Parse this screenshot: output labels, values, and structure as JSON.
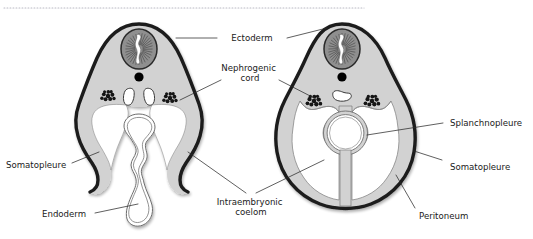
{
  "figure": {
    "top_rule": "dotted-rule",
    "background_color": "#ffffff",
    "ink_color": "#1a1a1a",
    "mesoderm_fill": "#d2d2d2",
    "neural_tube_fill": "#8f8f8f",
    "ectoderm_stroke": "#1c1c1c",
    "coelom_fill": "#ffffff",
    "notochord_fill": "#000000",
    "somite_fill": "#121212"
  },
  "labels": {
    "ectoderm": {
      "text": "Ectoderm",
      "lines": [
        "Ectoderm"
      ]
    },
    "nephrogenic_cord": {
      "text": "Nephrogenic cord",
      "lines": [
        "Nephrogenic",
        "cord"
      ]
    },
    "somatopleure_left": {
      "text": "Somatopleure",
      "lines": [
        "Somatopleure"
      ]
    },
    "endoderm": {
      "text": "Endoderm",
      "lines": [
        "Endoderm"
      ]
    },
    "intraembryonic_coelom": {
      "text": "Intraembryonic coelom",
      "lines": [
        "Intraembryonic",
        "coelom"
      ]
    },
    "splanchnopleure": {
      "text": "Splanchnopleure",
      "lines": [
        "Splanchnopleure"
      ]
    },
    "somatopleure_right": {
      "text": "Somatopleure",
      "lines": [
        "Somatopleure"
      ]
    },
    "peritoneum": {
      "text": "Peritoneum",
      "lines": [
        "Peritoneum"
      ]
    }
  },
  "panels": {
    "left": {
      "name": "earlier-folding-stage",
      "structures": [
        "neural-tube",
        "notochord",
        "paired-dorsal-aortae",
        "nephrogenic-cord-left",
        "nephrogenic-cord-right",
        "endoderm-gut-tube",
        "somatopleure-body-fold-left",
        "somatopleure-body-fold-right",
        "intraembryonic-coelom"
      ]
    },
    "right": {
      "name": "later-folding-stage",
      "structures": [
        "neural-tube",
        "notochord",
        "fused-dorsal-aorta",
        "nephrogenic-cord-left",
        "nephrogenic-cord-right",
        "gut-tube",
        "dorsal-mesentery",
        "ventral-mesentery",
        "peritoneal-cavity",
        "peritoneum"
      ]
    }
  }
}
